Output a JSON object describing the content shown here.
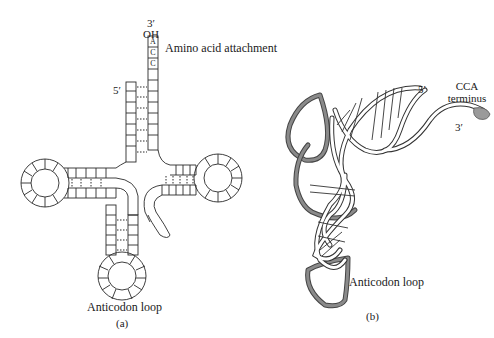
{
  "figure": {
    "panel_a": {
      "caption": "(a)",
      "three_prime_label": "3′",
      "oh_label": "OH",
      "terminal_bases": [
        "A",
        "C",
        "C"
      ],
      "amino_acid_label": "Amino acid attachment",
      "five_prime_label": "5′",
      "anticodon_label": "Anticodon loop"
    },
    "panel_b": {
      "caption": "(b)",
      "five_prime_label": "5′",
      "three_prime_label": "3′",
      "cca_label_line1": "CCA",
      "cca_label_line2": "terminus",
      "anticodon_label": "Anticodon loop"
    },
    "colors": {
      "line": "#2a2a2a",
      "strand_gray": "#7a7a7a",
      "cca_fill": "#9a9a9a"
    }
  }
}
